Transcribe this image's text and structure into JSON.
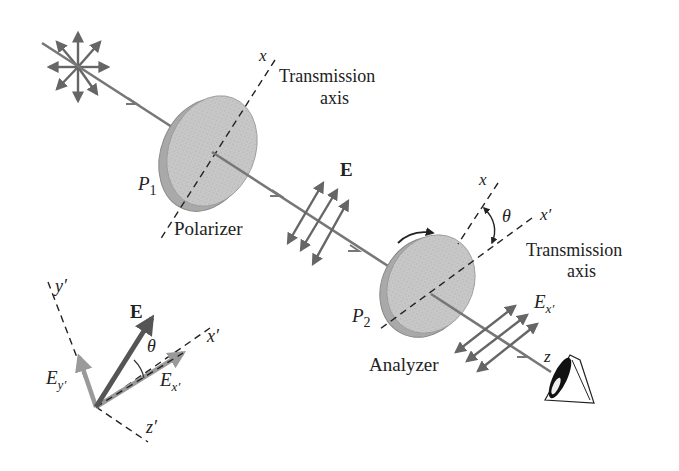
{
  "figure": {
    "colors": {
      "ray": "#777777",
      "vector": "#666666",
      "vector_dark": "#555555",
      "vector_light": "#9a9a9a",
      "disk_face": "#c9c9c9",
      "disk_edge": "#a9a9a9",
      "dashed_axis": "#222222",
      "text": "#222222"
    }
  },
  "source": {
    "label": "unpolarized light source"
  },
  "polarizer": {
    "name": "Polarizer",
    "symbol": "P",
    "subscript": "1",
    "axis_label": "x",
    "transmission_line1": "Transmission",
    "transmission_line2": "axis"
  },
  "field": {
    "label": "E"
  },
  "analyzer": {
    "name": "Analyzer",
    "symbol": "P",
    "subscript": "2",
    "axis_x": "x",
    "axis_xprime": "x′",
    "angle": "θ",
    "transmission_line1": "Transmission",
    "transmission_line2": "axis",
    "output_field": "E",
    "output_sub": "x′",
    "z_label": "z"
  },
  "inset": {
    "y_axis": "y′",
    "x_axis": "x′",
    "z_axis": "z′",
    "E": "E",
    "theta": "θ",
    "Ex": "E",
    "Ex_sub": "x′",
    "Ey": "E",
    "Ey_sub": "y′"
  }
}
